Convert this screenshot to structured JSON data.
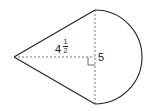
{
  "figure": {
    "labels": {
      "height": {
        "whole": "4",
        "numerator": "1",
        "denominator": "2"
      },
      "half_base": "5"
    },
    "stroke_color": "#222222",
    "dash_color": "#555555"
  }
}
